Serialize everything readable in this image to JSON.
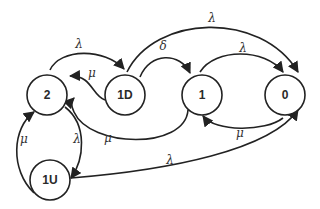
{
  "diagram": {
    "type": "state-transition",
    "colors": {
      "stroke": "#222222",
      "node_fill": "#ffffff",
      "text": "#2a2a2a"
    },
    "nodes": [
      {
        "id": "2",
        "label": "2",
        "x": 47,
        "y": 95
      },
      {
        "id": "1D",
        "label": "1D",
        "x": 125,
        "y": 95
      },
      {
        "id": "1",
        "label": "1",
        "x": 202,
        "y": 95
      },
      {
        "id": "0",
        "label": "0",
        "x": 285,
        "y": 95
      },
      {
        "id": "1U",
        "label": "1U",
        "x": 50,
        "y": 180
      }
    ],
    "edges": [
      {
        "from": "2",
        "to": "1D",
        "label": "λ"
      },
      {
        "from": "1D",
        "to": "2",
        "label": "μ"
      },
      {
        "from": "1D",
        "to": "1",
        "label": "δ"
      },
      {
        "from": "1D",
        "to": "0",
        "label": "λ"
      },
      {
        "from": "1",
        "to": "0",
        "label": "λ"
      },
      {
        "from": "0",
        "to": "1",
        "label": "μ"
      },
      {
        "from": "1",
        "to": "2",
        "label": "μ"
      },
      {
        "from": "2",
        "to": "1U",
        "label": "λ"
      },
      {
        "from": "1U",
        "to": "2",
        "label": "μ"
      },
      {
        "from": "1U",
        "to": "0",
        "label": "λ"
      }
    ]
  }
}
